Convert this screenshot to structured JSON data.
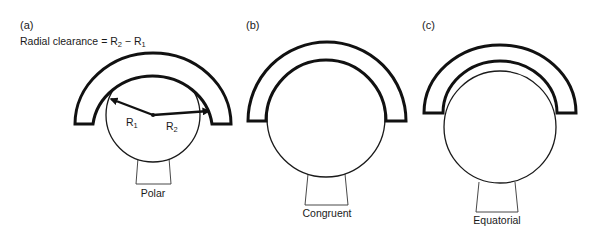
{
  "figure": {
    "panels": [
      {
        "id": "a",
        "letter": "(a)",
        "caption": "Polar",
        "equation": {
          "prefix": "Radial clearance = R",
          "sub2": "2",
          "minus": " − R",
          "sub1": "1"
        },
        "radius_labels": [
          {
            "name": "R",
            "sub": "1"
          },
          {
            "name": "R",
            "sub": "2"
          }
        ]
      },
      {
        "id": "b",
        "letter": "(b)",
        "caption": "Congruent"
      },
      {
        "id": "c",
        "letter": "(c)",
        "caption": "Equatorial"
      }
    ]
  }
}
